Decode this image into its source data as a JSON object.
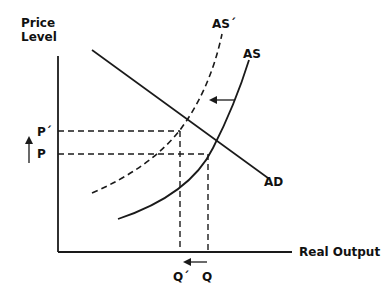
{
  "diagram": {
    "type": "aggregate-supply-aggregate-demand",
    "y_axis_label_line1": "Price",
    "y_axis_label_line2": "Level",
    "x_axis_label": "Real Output",
    "curves": {
      "as": "AS",
      "as_shifted": "AS´",
      "ad": "AD"
    },
    "price_labels": {
      "p_shifted": "P´",
      "p": "P"
    },
    "quantity_labels": {
      "q_shifted": "Q´",
      "q": "Q"
    },
    "shift_direction": "AS shifts left (decrease in aggregate supply): price rises from P to P´, output falls from Q to Q´",
    "colors": {
      "line": "#1a1a1a",
      "background": "#ffffff"
    }
  }
}
